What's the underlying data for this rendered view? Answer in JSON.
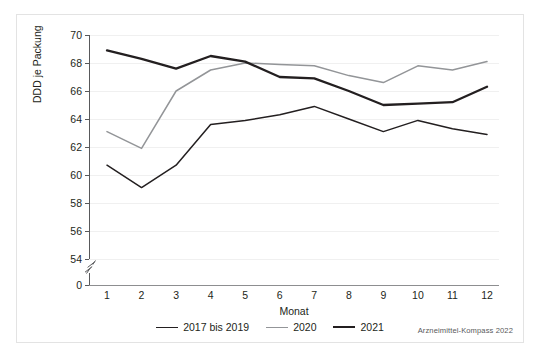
{
  "figure": {
    "source_note": "Arzneimittel-Kompass 2022"
  },
  "chart_data": {
    "type": "line",
    "title": "",
    "xlabel": "Monat",
    "ylabel": "DDD je Packung",
    "categories": [
      "1",
      "2",
      "3",
      "4",
      "5",
      "6",
      "7",
      "8",
      "9",
      "10",
      "11",
      "12"
    ],
    "x": [
      1,
      2,
      3,
      4,
      5,
      6,
      7,
      8,
      9,
      10,
      11,
      12
    ],
    "xlim": [
      1,
      12
    ],
    "ylim": [
      54,
      70
    ],
    "yticks": [
      70,
      68,
      66,
      64,
      62,
      60,
      58,
      56,
      54,
      0
    ],
    "ytick_labels": [
      "70",
      "68",
      "66",
      "64",
      "62",
      "60",
      "58",
      "56",
      "54",
      "0"
    ],
    "y_axis_break": true,
    "y_axis_break_between": [
      0,
      54
    ],
    "grid": "horizontal",
    "legend_position": "bottom-center",
    "series": [
      {
        "name": "2017 bis 2019",
        "color": "#231f20",
        "width": 1.5,
        "values": [
          60.7,
          59.1,
          60.7,
          63.6,
          63.9,
          64.3,
          64.9,
          64.0,
          63.1,
          63.9,
          63.3,
          62.9
        ]
      },
      {
        "name": "2020",
        "color": "#939598",
        "width": 1.5,
        "values": [
          63.1,
          61.9,
          66.0,
          67.5,
          68.0,
          67.9,
          67.8,
          67.1,
          66.6,
          67.8,
          67.5,
          68.1
        ]
      },
      {
        "name": "2021",
        "color": "#231f20",
        "width": 2.3,
        "values": [
          68.9,
          68.3,
          67.6,
          68.5,
          68.1,
          67.0,
          66.9,
          66.0,
          65.0,
          65.1,
          65.2,
          66.3
        ]
      }
    ]
  }
}
